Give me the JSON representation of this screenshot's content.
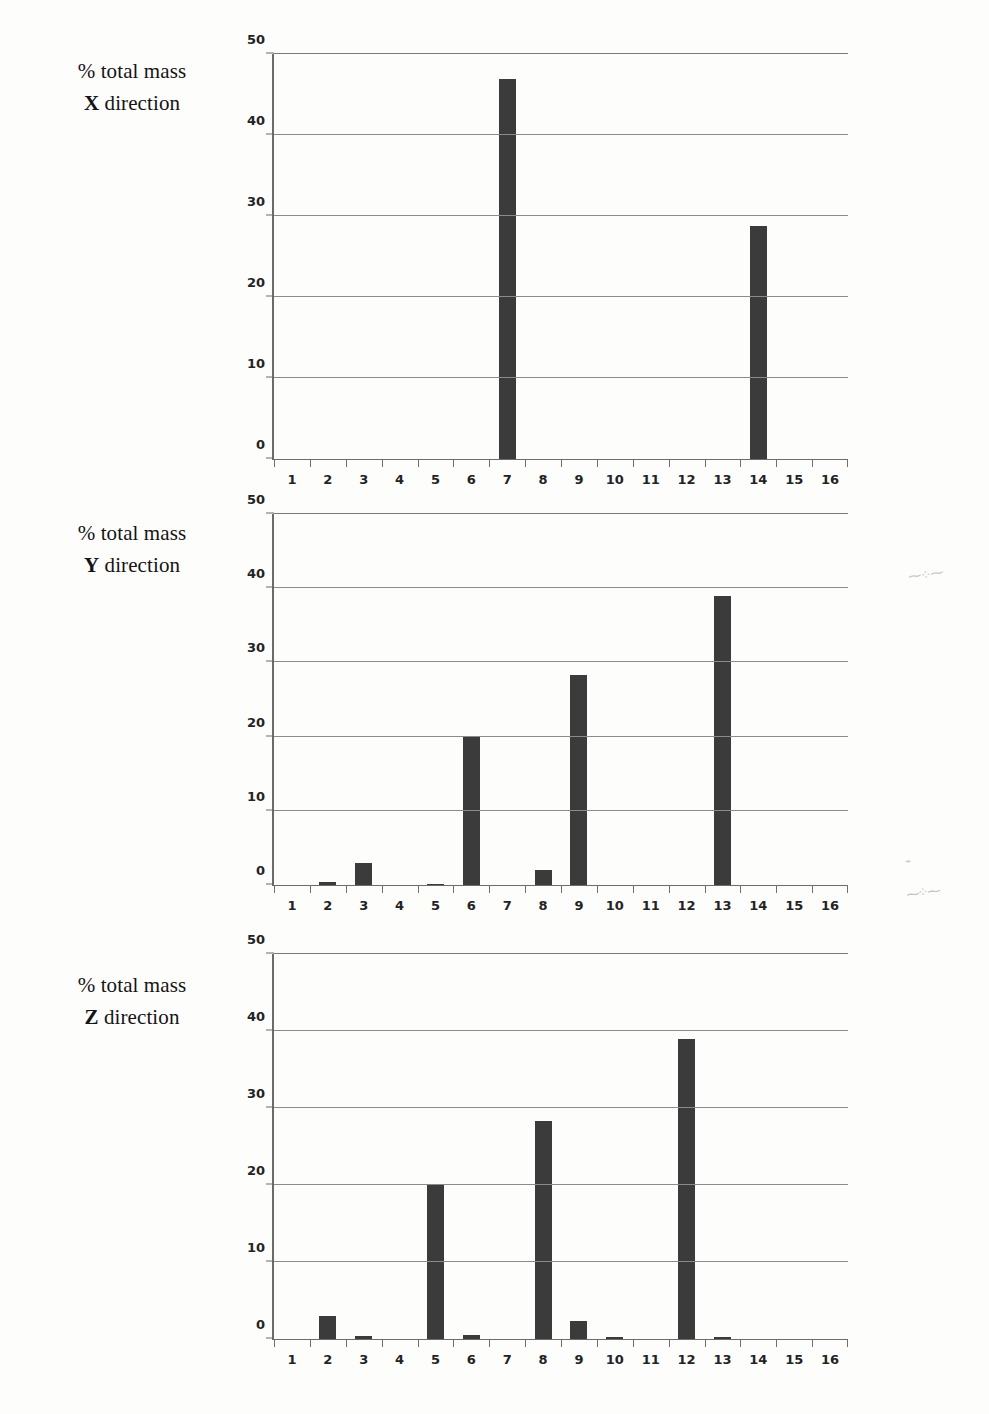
{
  "page": {
    "background_color": "#fdfdfc",
    "bar_color": "#3b3b3b",
    "grid_color": "#8b8b8b",
    "axis_color": "#6b6b6b"
  },
  "artifacts": {
    "smudge_top": "⁓⁘⁓",
    "smudge_mid": "⌁",
    "smudge_low": "⁓⁘⁓"
  },
  "charts": [
    {
      "caption_line1": "% total mass",
      "caption_dir": "X",
      "caption_line2_rest": " direction"
    },
    {
      "caption_line1": "% total mass",
      "caption_dir": "Y",
      "caption_line2_rest": " direction"
    },
    {
      "caption_line1": "% total mass",
      "caption_dir": "Z",
      "caption_line2_rest": " direction"
    }
  ],
  "chart_data": [
    {
      "type": "bar",
      "title": "% total mass X direction",
      "xlabel": "",
      "ylabel": "% total mass",
      "ylim": [
        0,
        50
      ],
      "yticks": [
        0,
        10,
        20,
        30,
        40,
        50
      ],
      "ytick_labels": [
        "0",
        "10",
        "20",
        "30",
        "40",
        "50"
      ],
      "grid": true,
      "legend": "none",
      "categories": [
        "1",
        "2",
        "3",
        "4",
        "5",
        "6",
        "7",
        "8",
        "9",
        "10",
        "11",
        "12",
        "13",
        "14",
        "15",
        "16"
      ],
      "values": [
        0,
        0,
        0,
        0,
        0,
        0,
        46.9,
        0,
        0,
        0,
        0,
        0,
        0,
        28.8,
        0,
        0
      ]
    },
    {
      "type": "bar",
      "title": "% total mass Y direction",
      "xlabel": "",
      "ylabel": "% total mass",
      "ylim": [
        0,
        50
      ],
      "yticks": [
        0,
        10,
        20,
        30,
        40,
        50
      ],
      "ytick_labels": [
        "0",
        "10",
        "20",
        "30",
        "40",
        "50"
      ],
      "grid": true,
      "legend": "none",
      "categories": [
        "1",
        "2",
        "3",
        "4",
        "5",
        "6",
        "7",
        "8",
        "9",
        "10",
        "11",
        "12",
        "13",
        "14",
        "15",
        "16"
      ],
      "values": [
        0,
        0.4,
        3.0,
        0,
        0.2,
        20.0,
        0,
        2.0,
        28.3,
        0,
        0,
        0,
        39.0,
        0,
        0,
        0
      ]
    },
    {
      "type": "bar",
      "title": "% total mass Z direction",
      "xlabel": "",
      "ylabel": "% total mass",
      "ylim": [
        0,
        50
      ],
      "yticks": [
        0,
        10,
        20,
        30,
        40,
        50
      ],
      "ytick_labels": [
        "0",
        "10",
        "20",
        "30",
        "40",
        "50"
      ],
      "grid": true,
      "legend": "none",
      "categories": [
        "1",
        "2",
        "3",
        "4",
        "5",
        "6",
        "7",
        "8",
        "9",
        "10",
        "11",
        "12",
        "13",
        "14",
        "15",
        "16"
      ],
      "values": [
        0,
        3.0,
        0.4,
        0,
        20.0,
        0.5,
        0,
        28.3,
        2.3,
        0.2,
        0,
        39.0,
        0.3,
        0,
        0,
        0
      ]
    }
  ]
}
